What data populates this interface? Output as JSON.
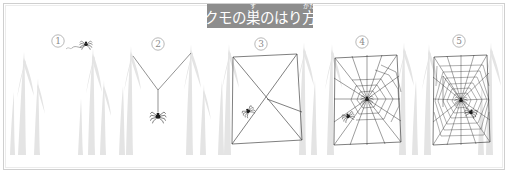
{
  "figure": {
    "title_main": "クモの巣のはり方",
    "title_segments": [
      {
        "text": "ク",
        "ruby": ""
      },
      {
        "text": "モ",
        "ruby": ""
      },
      {
        "text": "の",
        "ruby": ""
      },
      {
        "text": "巣",
        "ruby": "す"
      },
      {
        "text": "の",
        "ruby": ""
      },
      {
        "text": "は",
        "ruby": ""
      },
      {
        "text": "り",
        "ruby": ""
      },
      {
        "text": "方",
        "ruby": "かた"
      }
    ],
    "background_color": "#ffffff",
    "banner_color": "#8d8d8d",
    "banner_text_color": "#ffffff",
    "border_color": "#cfcfcf",
    "web_line_color": "#3a3a3a",
    "plant_color": "#e3e3e3",
    "spider_color": "#1c1c1c",
    "number_color": "#8a8a8a"
  },
  "panels": [
    {
      "id": "panel-1",
      "number": "1",
      "number_cx": 58,
      "number_cy": 41,
      "caption": "",
      "description": "spider on branch tip releasing a floating silk thread"
    },
    {
      "id": "panel-2",
      "number": "2",
      "number_cx": 158,
      "number_cy": 44,
      "caption": "",
      "description": "Y-shaped bridge thread with spider hanging below"
    },
    {
      "id": "panel-3",
      "number": "3",
      "number_cx": 261,
      "number_cy": 44,
      "caption": "",
      "description": "rectangular frame with crossing foundation lines"
    },
    {
      "id": "panel-4",
      "number": "4",
      "number_cx": 362,
      "number_cy": 42,
      "caption": "",
      "description": "radial spokes complete with auxiliary spiral started"
    },
    {
      "id": "panel-5",
      "number": "5",
      "number_cx": 459,
      "number_cy": 41,
      "caption": "",
      "description": "finished orb web with full capture spiral and two spiders"
    }
  ]
}
